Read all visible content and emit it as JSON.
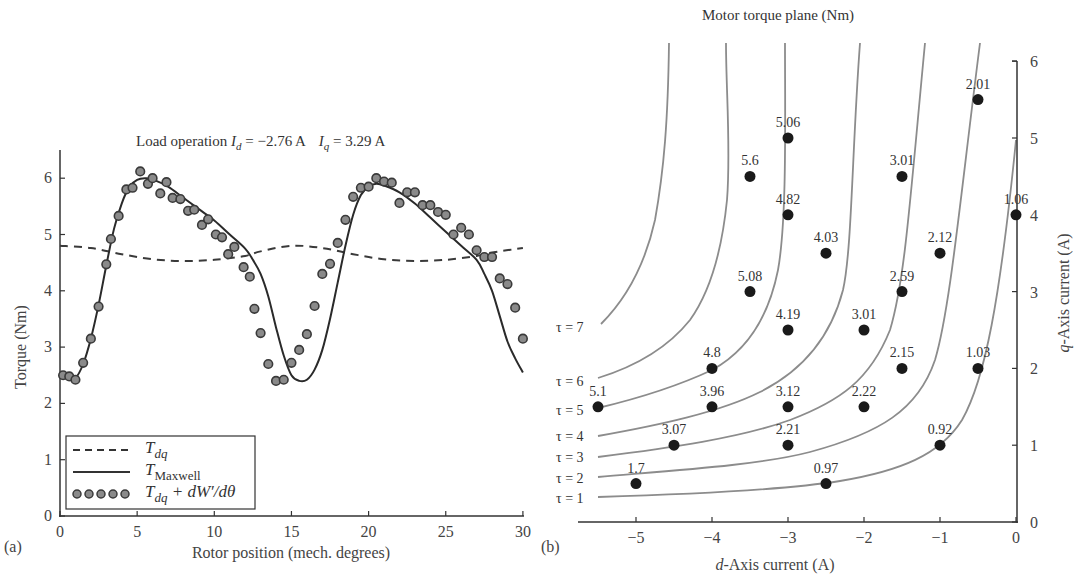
{
  "panels": {
    "a": {
      "label": "(a)"
    },
    "b": {
      "label": "(b)"
    }
  },
  "chart_data": [
    {
      "type": "line",
      "panel": "(a)",
      "title": "Load operation I_d = −2.76 A   I_q = 3.29 A",
      "title_parts": {
        "prefix": "Load operation ",
        "id_sym": "I",
        "id_sub": "d",
        "id_val": " = −2.76 A",
        "iq_sym": "I",
        "iq_sub": "q",
        "iq_val": " = 3.29 A"
      },
      "xlabel": "Rotor position (mech. degrees)",
      "ylabel": "Torque (Nm)",
      "xlim": [
        0,
        30
      ],
      "ylim": [
        0,
        6.5
      ],
      "xticks": [
        0,
        5,
        10,
        15,
        20,
        25,
        30
      ],
      "yticks": [
        0,
        1,
        2,
        3,
        4,
        5,
        6
      ],
      "grid": false,
      "legend_position": "lower left",
      "legend": [
        {
          "style": "dashed",
          "label": "T",
          "sub": "dq",
          "extra": ""
        },
        {
          "style": "solid",
          "label": "T",
          "sub": "Maxwell",
          "extra": ""
        },
        {
          "style": "markers",
          "label": "T",
          "sub": "dq",
          "extra": " + dW′/dθ"
        }
      ],
      "series": [
        {
          "name": "T_dq",
          "style": "dashed",
          "x": [
            0,
            2,
            4,
            6,
            8,
            10,
            12,
            13,
            15,
            17,
            19,
            21,
            23,
            25,
            27,
            28,
            30
          ],
          "y": [
            4.8,
            4.76,
            4.65,
            4.56,
            4.53,
            4.55,
            4.62,
            4.7,
            4.8,
            4.76,
            4.65,
            4.56,
            4.53,
            4.55,
            4.62,
            4.68,
            4.76
          ]
        },
        {
          "name": "T_Maxwell",
          "style": "solid",
          "x": [
            0,
            0.5,
            1,
            1.5,
            2,
            2.5,
            3,
            3.5,
            4,
            4.5,
            5,
            5.5,
            6,
            7,
            8,
            9,
            10,
            11,
            12,
            12.5,
            13,
            13.5,
            14,
            14.5,
            15,
            15.5,
            16,
            16.5,
            17,
            17.5,
            18,
            18.5,
            19,
            19.5,
            20,
            20.5,
            21,
            22,
            23,
            24,
            25,
            26,
            27,
            27.5,
            28,
            28.5,
            29,
            29.5,
            30
          ],
          "y": [
            2.5,
            2.45,
            2.45,
            2.7,
            3.15,
            3.75,
            4.45,
            5.1,
            5.55,
            5.85,
            5.97,
            6.0,
            5.98,
            5.85,
            5.65,
            5.45,
            5.25,
            5.0,
            4.75,
            4.55,
            4.3,
            3.9,
            3.35,
            2.85,
            2.5,
            2.4,
            2.42,
            2.6,
            2.95,
            3.5,
            4.15,
            4.8,
            5.35,
            5.7,
            5.85,
            5.9,
            5.87,
            5.75,
            5.55,
            5.3,
            5.05,
            4.8,
            4.55,
            4.3,
            4.0,
            3.55,
            3.1,
            2.8,
            2.55
          ]
        },
        {
          "name": "T_dq + dW'/dθ",
          "style": "markers",
          "x": [
            0.2,
            0.6,
            1.0,
            1.5,
            2.0,
            2.5,
            3.0,
            3.3,
            3.8,
            4.3,
            4.7,
            5.2,
            5.7,
            6.0,
            6.5,
            6.9,
            7.3,
            7.8,
            8.3,
            8.7,
            9.2,
            9.6,
            10.1,
            10.5,
            10.9,
            11.3,
            11.9,
            12.3,
            12.6,
            13.0,
            13.5,
            14.0,
            14.5,
            15.0,
            15.5,
            16.0,
            16.5,
            17.0,
            17.5,
            18.0,
            18.5,
            19.0,
            19.5,
            20.0,
            20.5,
            21.0,
            21.5,
            22.0,
            22.5,
            23.0,
            23.5,
            24.0,
            24.5,
            25.0,
            25.5,
            26.0,
            26.5,
            27.0,
            27.5,
            28.0,
            28.5,
            29.0,
            29.5,
            30.0
          ],
          "y": [
            2.5,
            2.48,
            2.42,
            2.72,
            3.15,
            3.72,
            4.47,
            4.92,
            5.33,
            5.8,
            5.83,
            6.12,
            5.9,
            6.0,
            5.73,
            5.93,
            5.65,
            5.63,
            5.42,
            5.44,
            5.17,
            5.27,
            5.0,
            4.95,
            4.65,
            4.78,
            4.42,
            4.25,
            3.68,
            3.25,
            2.7,
            2.4,
            2.42,
            2.72,
            2.95,
            3.23,
            3.73,
            4.3,
            4.48,
            4.85,
            5.26,
            5.67,
            5.83,
            5.85,
            6.0,
            5.94,
            5.92,
            5.56,
            5.75,
            5.75,
            5.52,
            5.52,
            5.4,
            5.35,
            5.0,
            5.12,
            5.0,
            4.72,
            4.6,
            4.6,
            4.22,
            4.12,
            3.7,
            3.15,
            2.65
          ]
        }
      ]
    },
    {
      "type": "scatter",
      "panel": "(b)",
      "title": "Motor torque plane (Nm)",
      "xlabel": "d-Axis current (A)",
      "xlabel_parts": {
        "sym": "d",
        "rest": "-Axis current (A)"
      },
      "ylabel": "q-Axis current (A)",
      "ylabel_parts": {
        "sym": "q",
        "rest": "-Axis current (A)"
      },
      "xlim": [
        -5.76,
        0
      ],
      "ylim": [
        0,
        6
      ],
      "xticks": [
        -5,
        -4,
        -3,
        -2,
        -1,
        0
      ],
      "xtick_labels": [
        "−5",
        "−4",
        "−3",
        "−2",
        "−1",
        "0"
      ],
      "yticks": [
        0,
        1,
        2,
        3,
        4,
        5,
        6
      ],
      "y_axis_position": "right",
      "grid": false,
      "contours": [
        {
          "label": "τ = 1",
          "value": 1
        },
        {
          "label": "τ = 2",
          "value": 2
        },
        {
          "label": "τ = 3",
          "value": 3
        },
        {
          "label": "τ = 4",
          "value": 4
        },
        {
          "label": "τ = 5",
          "value": 5
        },
        {
          "label": "τ = 6",
          "value": 6
        },
        {
          "label": "τ = 7",
          "value": 7
        }
      ],
      "points": [
        {
          "d": -3.0,
          "q": 5.0,
          "torque": "5.06"
        },
        {
          "d": -3.5,
          "q": 4.5,
          "torque": "5.6"
        },
        {
          "d": -0.5,
          "q": 5.5,
          "torque": "2.01"
        },
        {
          "d": -1.5,
          "q": 4.5,
          "torque": "3.01"
        },
        {
          "d": -3.0,
          "q": 4.0,
          "torque": "4.82"
        },
        {
          "d": 0.0,
          "q": 4.0,
          "torque": "1.06"
        },
        {
          "d": -2.5,
          "q": 3.5,
          "torque": "4.03"
        },
        {
          "d": -1.0,
          "q": 3.5,
          "torque": "2.12"
        },
        {
          "d": -3.5,
          "q": 3.0,
          "torque": "5.08"
        },
        {
          "d": -1.5,
          "q": 3.0,
          "torque": "2.59"
        },
        {
          "d": -3.0,
          "q": 2.5,
          "torque": "4.19"
        },
        {
          "d": -2.0,
          "q": 2.5,
          "torque": "3.01"
        },
        {
          "d": -4.0,
          "q": 2.0,
          "torque": "4.8"
        },
        {
          "d": -1.5,
          "q": 2.0,
          "torque": "2.15"
        },
        {
          "d": -0.5,
          "q": 2.0,
          "torque": "1.03"
        },
        {
          "d": -5.5,
          "q": 1.5,
          "torque": "5.1"
        },
        {
          "d": -4.0,
          "q": 1.5,
          "torque": "3.96"
        },
        {
          "d": -3.0,
          "q": 1.5,
          "torque": "3.12"
        },
        {
          "d": -2.0,
          "q": 1.5,
          "torque": "2.22"
        },
        {
          "d": -4.5,
          "q": 1.0,
          "torque": "3.07"
        },
        {
          "d": -3.0,
          "q": 1.0,
          "torque": "2.21"
        },
        {
          "d": -1.0,
          "q": 1.0,
          "torque": "0.92"
        },
        {
          "d": -5.0,
          "q": 0.5,
          "torque": "1.7"
        },
        {
          "d": -2.5,
          "q": 0.5,
          "torque": "0.97"
        }
      ]
    }
  ]
}
